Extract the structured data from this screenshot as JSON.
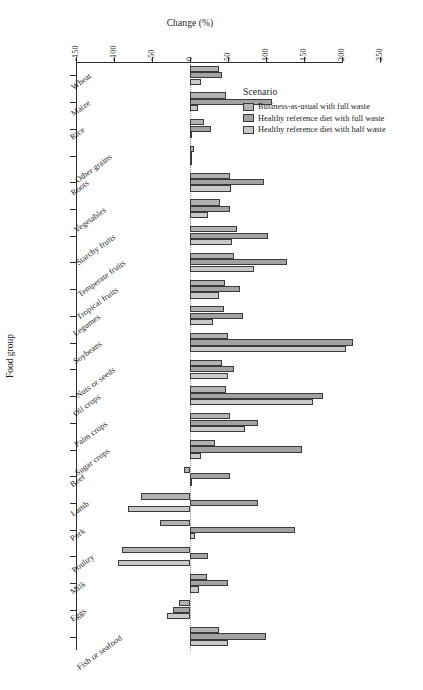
{
  "chart_data": {
    "type": "bar",
    "orientation": "horizontal",
    "title": "",
    "xlabel": "Change (%)",
    "ylabel": "Food group",
    "xlim": [
      -150,
      250
    ],
    "xticks": [
      -150,
      -100,
      -50,
      0,
      50,
      100,
      150,
      200,
      250
    ],
    "xtick_labels": [
      "-150",
      "-100",
      "-50",
      "0",
      "50",
      "100",
      "150",
      "200",
      "250"
    ],
    "grid": false,
    "zero_reference_line": true,
    "legend_title": "Scenario",
    "legend_position": "top-right-inside",
    "categories": [
      "Wheat",
      "Maize",
      "Rice",
      "Other grains",
      "Roots",
      "Vegetables",
      "Starchy fruits",
      "Temperate fruits",
      "Tropical fruits",
      "Legumes",
      "Soybeans",
      "Nuts or seeds",
      "Oil crops",
      "Palm crops",
      "Sugar crops",
      "Beef",
      "Lamb",
      "Pork",
      "Poultry",
      "Milk",
      "Eggs",
      "Fish or seafood"
    ],
    "series": [
      {
        "name": "Business-as-usual with full waste",
        "color": "#b2b2b2",
        "values": [
          38,
          48,
          19,
          5,
          52,
          40,
          62,
          58,
          46,
          45,
          50,
          42,
          47,
          52,
          33,
          -8,
          -65,
          -40,
          -90,
          22,
          -15,
          38
        ]
      },
      {
        "name": "Healthy reference diet with full waste",
        "color": "#a3a3a3",
        "values": [
          42,
          108,
          28,
          3,
          98,
          52,
          102,
          128,
          66,
          70,
          215,
          58,
          175,
          90,
          148,
          52,
          90,
          138,
          24,
          50,
          -22,
          100
        ]
      },
      {
        "name": "Healthy reference diet with half waste",
        "color": "#c9c9c9",
        "values": [
          14,
          10,
          3,
          2,
          54,
          24,
          55,
          84,
          38,
          30,
          205,
          50,
          162,
          72,
          14,
          2,
          -82,
          6,
          -95,
          12,
          -30,
          50
        ]
      }
    ]
  },
  "caption": {
    "text": ""
  }
}
